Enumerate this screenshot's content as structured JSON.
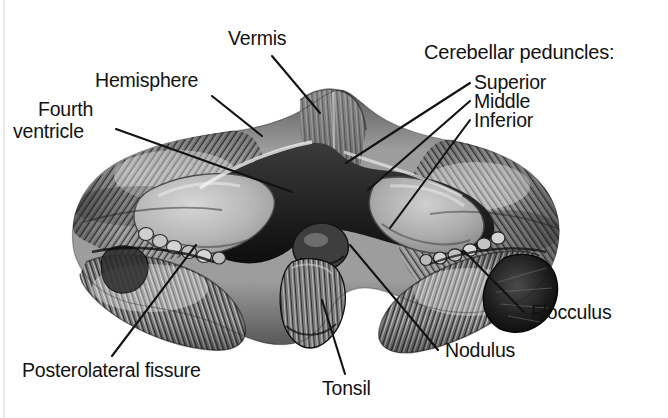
{
  "figure": {
    "style": "grayscale pen-and-ink anatomical illustration",
    "background_color": "#ffffff",
    "ink_color": "#121212",
    "width": 668,
    "height": 418
  },
  "labels": {
    "vermis": "Vermis",
    "hemisphere": "Hemisphere",
    "fourth_ventricle_line1": "Fourth",
    "fourth_ventricle_line2": "ventricle",
    "peduncles_heading": "Cerebellar peduncles:",
    "peduncle_superior": "Superior",
    "peduncle_middle": "Middle",
    "peduncle_inferior": "Inferior",
    "flocculus": "Flocculus",
    "nodulus": "Nodulus",
    "tonsil": "Tonsil",
    "posterolateral_fissure": "Posterolateral fissure"
  }
}
